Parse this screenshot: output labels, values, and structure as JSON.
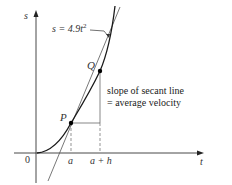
{
  "diagram": {
    "axes": {
      "vertical_label": "s",
      "horizontal_label": "t",
      "origin_label": "0"
    },
    "curve": {
      "equation_lhs": "s = 4.9",
      "equation_var": "t",
      "equation_exp": "2"
    },
    "points": [
      {
        "label": "P",
        "x_label": "a"
      },
      {
        "label": "Q",
        "x_label": "a + h"
      }
    ],
    "annotation": {
      "line1": "slope of secant line",
      "line2": "= average velocity"
    },
    "colors": {
      "curve": "#1a1a1a",
      "secant": "#555555",
      "axes": "#333333",
      "guides": "#666666",
      "background": "#ffffff"
    }
  }
}
